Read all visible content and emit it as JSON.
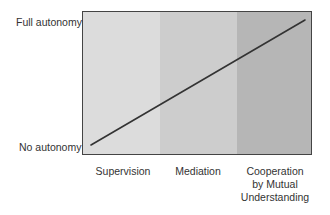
{
  "diagram": {
    "y_axis": {
      "top_label": "Full autonomy",
      "bottom_label": "No autonomy"
    },
    "x_axis": {
      "categories": [
        "Supervision",
        "Mediation",
        "Cooperation by Mutual Understanding"
      ],
      "category_lines": [
        [
          "Supervision"
        ],
        [
          "Mediation"
        ],
        [
          "Cooperation",
          "by Mutual",
          "Understanding"
        ]
      ]
    },
    "bands": [
      {
        "label": "Supervision",
        "color": "#dcdcdc"
      },
      {
        "label": "Mediation",
        "color": "#cdcdcd"
      },
      {
        "label": "Cooperation by Mutual Understanding",
        "color": "#b6b6b6"
      }
    ],
    "trend_line": {
      "direction": "increasing",
      "from": "No autonomy",
      "to": "Full autonomy",
      "color": "#333333"
    }
  }
}
